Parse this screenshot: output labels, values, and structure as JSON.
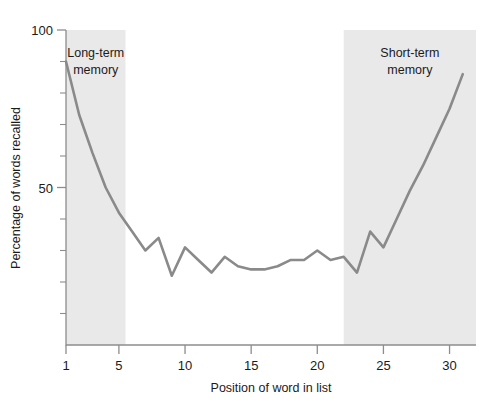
{
  "chart_data": {
    "type": "line",
    "title": "",
    "xlabel": "Position of word in list",
    "ylabel": "Percentage of words recalled",
    "xlim": [
      1,
      32
    ],
    "ylim": [
      0,
      100
    ],
    "grid": false,
    "legend_position": "none",
    "line_color": "#8a8a8a",
    "band_color": "#e9e9e9",
    "x_ticks": [
      1,
      5,
      10,
      15,
      20,
      25,
      30
    ],
    "x_tick_labels": [
      "1",
      "5",
      "10",
      "15",
      "20",
      "25",
      "30"
    ],
    "y_ticks": [
      50,
      100
    ],
    "y_tick_labels": [
      "50",
      "100"
    ],
    "y_minor_ticks": [
      10,
      20,
      30,
      40,
      60,
      70,
      80,
      90
    ],
    "series": [
      {
        "name": "Recall",
        "x": [
          1,
          2,
          3,
          4,
          5,
          6,
          7,
          8,
          9,
          10,
          11,
          12,
          13,
          14,
          15,
          16,
          17,
          18,
          19,
          20,
          21,
          22,
          23,
          24,
          25,
          26,
          27,
          28,
          29,
          30,
          31
        ],
        "values": [
          90,
          73,
          61,
          50,
          42,
          36,
          30,
          34,
          22,
          31,
          27,
          23,
          28,
          25,
          24,
          24,
          25,
          27,
          27,
          30,
          27,
          28,
          23,
          36,
          31,
          40,
          49,
          57,
          66,
          75,
          86
        ]
      }
    ],
    "bands": [
      {
        "label_line1": "Long-term",
        "label_line2": "memory",
        "x_start": 1.0,
        "x_end": 5.5
      },
      {
        "label_line1": "Short-term",
        "label_line2": "memory",
        "x_start": 22.0,
        "x_end": 32.0
      }
    ]
  }
}
